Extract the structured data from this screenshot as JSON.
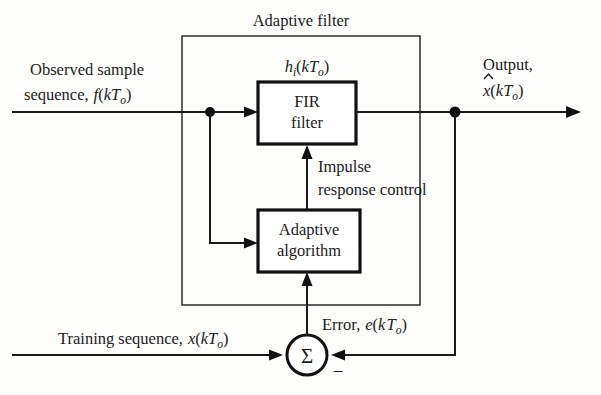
{
  "diagram": {
    "boundary_label": "Adaptive filter",
    "blocks": [
      {
        "id": "fir",
        "line1": "FIR",
        "line2": "filter"
      },
      {
        "id": "adaptive",
        "line1": "Adaptive",
        "line2": "algorithm"
      }
    ],
    "sum_symbol": "Σ",
    "minus_symbol": "−",
    "labels": {
      "input_line1": "Observed sample",
      "input_line2_prefix": "sequence,",
      "input_line2_fn": "f",
      "input_line2_arg_open": "(",
      "input_line2_k": "k",
      "input_line2_T": "T",
      "input_line2_sub": "o",
      "input_line2_arg_close": ")",
      "impulse_response_line1": "Impulse",
      "impulse_response_line2": "response control",
      "coeff_h": "h",
      "coeff_sub": "i",
      "coeff_arg_open": "(",
      "coeff_k": "k",
      "coeff_T": "T",
      "coeff_T_sub": "o",
      "coeff_arg_close": ")",
      "output_line1": "Output,",
      "output_hat": "̂",
      "output_x": "x",
      "output_arg_open": "(",
      "output_k": "k",
      "output_T": "T",
      "output_sub": "o",
      "output_arg_close": ")",
      "error_prefix": "Error,",
      "error_e": "e",
      "error_arg_open": "(",
      "error_k": "k",
      "error_T": "T",
      "error_sub": "o",
      "error_arg_close": ")",
      "training_prefix": "Training sequence,",
      "training_x": "x",
      "training_arg_open": "(",
      "training_k": "k",
      "training_T": "T",
      "training_sub": "o",
      "training_arg_close": ")"
    },
    "colors": {
      "ink": "#111111",
      "wire": "#1a1a1a",
      "boundary": "#2b2b2b",
      "paper": "#fdfdfc"
    }
  }
}
